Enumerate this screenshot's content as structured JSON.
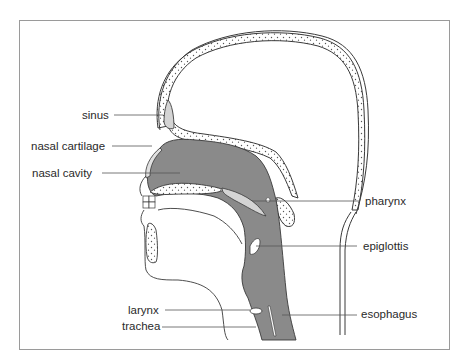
{
  "diagram": {
    "type": "anatomical cross-section",
    "colors": {
      "airway_fill": "#8a8a8a",
      "sinus_fill": "#d4d4d4",
      "bone_fill": "#ffffff",
      "outline": "#3a3a3a",
      "frame": "#9a9a9a",
      "leader_line": "#555555"
    },
    "labels_left": [
      {
        "id": "sinus",
        "text": "sinus"
      },
      {
        "id": "nasal_cartilage",
        "text": "nasal cartilage"
      },
      {
        "id": "nasal_cavity",
        "text": "nasal cavity"
      },
      {
        "id": "larynx",
        "text": "larynx"
      },
      {
        "id": "trachea",
        "text": "trachea"
      }
    ],
    "labels_right": [
      {
        "id": "pharynx",
        "text": "pharynx"
      },
      {
        "id": "epiglottis",
        "text": "epiglottis"
      },
      {
        "id": "esophagus",
        "text": "esophagus"
      }
    ]
  }
}
